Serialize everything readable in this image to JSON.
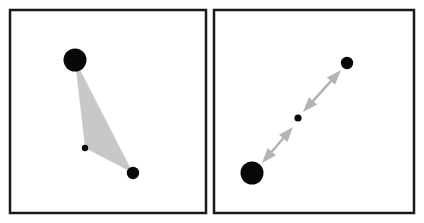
{
  "figure": {
    "width": 424,
    "height": 223,
    "background_color": "#ffffff",
    "panel_count": 2
  },
  "colors": {
    "frame_stroke": "#1a1a1a",
    "point_fill": "#080808",
    "triangle_fill": "#c8c8c8",
    "arrow_fill": "#b4b4b4",
    "panel_background": "#ffffff"
  },
  "panels": [
    {
      "id": "left-panel",
      "label": "Left panel",
      "frame": {
        "x": 10,
        "y": 10,
        "width": 196,
        "height": 203,
        "stroke_width": 2.5
      },
      "points": [
        {
          "name": "large-point",
          "cx": 75,
          "cy": 60,
          "r": 11.5,
          "size_label": "large"
        },
        {
          "name": "small-point",
          "cx": 85,
          "cy": 148,
          "r": 3.2,
          "size_label": "small"
        },
        {
          "name": "medium-point",
          "cx": 133,
          "cy": 173,
          "r": 6.2,
          "size_label": "medium"
        }
      ],
      "triangle": {
        "name": "triangle-region",
        "vertices": [
          [
            75,
            60
          ],
          [
            85,
            148
          ],
          [
            133,
            173
          ]
        ],
        "fill": "#c8c8c8"
      },
      "arrows": []
    },
    {
      "id": "right-panel",
      "label": "Right panel",
      "frame": {
        "x": 214,
        "y": 10,
        "width": 200,
        "height": 203,
        "stroke_width": 2.5
      },
      "points": [
        {
          "name": "large-point",
          "cx": 252,
          "cy": 173,
          "r": 11.5,
          "size_label": "large"
        },
        {
          "name": "small-point",
          "cx": 298,
          "cy": 118,
          "r": 3.6,
          "size_label": "small"
        },
        {
          "name": "medium-point",
          "cx": 347,
          "cy": 63,
          "r": 6.2,
          "size_label": "medium"
        }
      ],
      "triangle": null,
      "arrows": [
        {
          "name": "arrow-upper",
          "style": "double-headed",
          "from": [
            303,
            112
          ],
          "to": [
            341,
            70
          ],
          "shaft_width": 2.6,
          "head_length": 15,
          "head_width": 11
        },
        {
          "name": "arrow-lower",
          "style": "double-headed",
          "from": [
            262,
            163
          ],
          "to": [
            293,
            127
          ],
          "shaft_width": 2.6,
          "head_length": 15,
          "head_width": 11
        }
      ]
    }
  ]
}
